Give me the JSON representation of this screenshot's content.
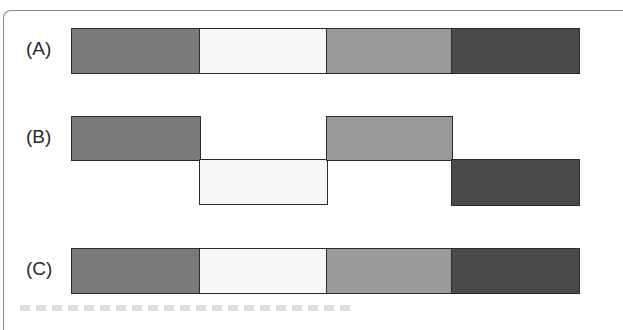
{
  "diagram": {
    "rows": [
      {
        "id": "A",
        "label": "(A)",
        "layout": "aligned"
      },
      {
        "id": "B",
        "label": "(B)",
        "layout": "staggered"
      },
      {
        "id": "C",
        "label": "(C)",
        "layout": "aligned"
      }
    ],
    "segment_colors": [
      "#7a7a7a",
      "#f7f7f7",
      "#9a9a9a",
      "#4a4a4a"
    ],
    "border_color": "#2b2b2b",
    "caption_visible": "partially cropped, illegible"
  }
}
